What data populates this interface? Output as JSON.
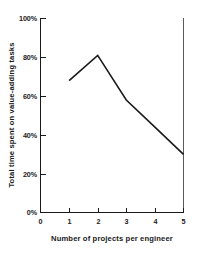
{
  "chart_data": {
    "type": "line",
    "title": "",
    "xlabel": "Number of projects per engineer",
    "ylabel": "Total time spent on value-adding tasks",
    "x": [
      1,
      2,
      3,
      4,
      5
    ],
    "values": [
      68,
      81,
      58,
      44,
      30
    ],
    "series": [
      {
        "name": "Total time spent on value-adding tasks",
        "values": [
          68,
          81,
          58,
          44,
          30
        ]
      }
    ],
    "xlim": [
      0,
      5
    ],
    "ylim": [
      0,
      100
    ],
    "xticks": [
      "0",
      "1",
      "2",
      "3",
      "4",
      "5"
    ],
    "yticks": [
      "0%",
      "20%",
      "40%",
      "60%",
      "80%",
      "100%"
    ],
    "xtick_values": [
      0,
      1,
      2,
      3,
      4,
      5
    ],
    "ytick_values": [
      0,
      20,
      40,
      60,
      80,
      100
    ],
    "grid": false,
    "legend": "none",
    "line_color": "#1a1a1a",
    "background_color": "#ffffff"
  }
}
